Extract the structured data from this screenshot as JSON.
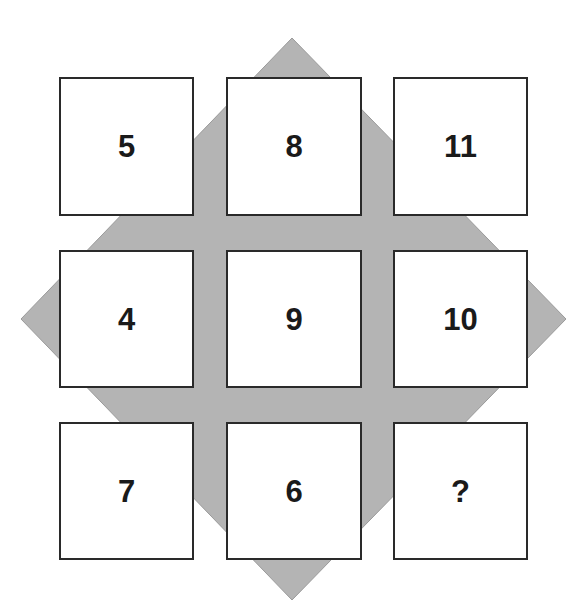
{
  "puzzle": {
    "background_shape": "diamond",
    "colors": {
      "diamond_fill": "#b4b4b4",
      "diamond_stroke": "#9a9a9a",
      "cell_fill": "#ffffff",
      "cell_border": "#2a2a2a",
      "text": "#1a1a1a"
    },
    "grid": [
      [
        "5",
        "8",
        "11"
      ],
      [
        "4",
        "9",
        "10"
      ],
      [
        "7",
        "6",
        "?"
      ]
    ],
    "cells": [
      {
        "row": 0,
        "col": 0,
        "value": "5"
      },
      {
        "row": 0,
        "col": 1,
        "value": "8"
      },
      {
        "row": 0,
        "col": 2,
        "value": "11"
      },
      {
        "row": 1,
        "col": 0,
        "value": "4"
      },
      {
        "row": 1,
        "col": 1,
        "value": "9"
      },
      {
        "row": 1,
        "col": 2,
        "value": "10"
      },
      {
        "row": 2,
        "col": 0,
        "value": "7"
      },
      {
        "row": 2,
        "col": 1,
        "value": "6"
      },
      {
        "row": 2,
        "col": 2,
        "value": "?"
      }
    ]
  }
}
